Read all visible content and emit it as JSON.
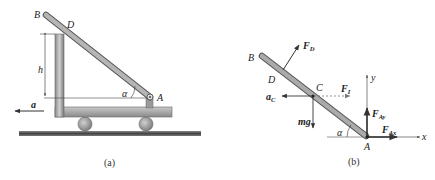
{
  "figure": {
    "panel_a": {
      "caption": "(a)",
      "labels": {
        "B": "B",
        "D": "D",
        "A": "A",
        "h": "h",
        "alpha": "α",
        "a": "a"
      }
    },
    "panel_b": {
      "caption": "(b)",
      "labels": {
        "B": "B",
        "D": "D",
        "C": "C",
        "A": "A",
        "alpha": "α",
        "x": "x",
        "y": "y",
        "F_D_main": "F",
        "F_D_sub": "D",
        "F_I_main": "F",
        "F_I_sub": "I",
        "a_C_main": "a",
        "a_C_sub": "C",
        "mg": "mg",
        "F_Ay_main": "F",
        "F_Ay_sub": "Ay",
        "F_Ax_main": "F",
        "F_Ax_sub": "Ax"
      }
    },
    "colors": {
      "bar": "#9a9a9a",
      "bar_dark": "#5e5e5e",
      "ground": "#555555",
      "arrow": "#333333"
    }
  }
}
